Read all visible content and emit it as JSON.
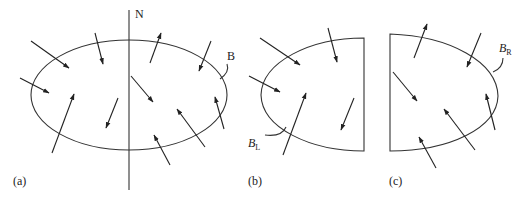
{
  "figure": {
    "panels": [
      {
        "id": "a",
        "label": "(a)",
        "boundary_label": "B",
        "divider_label": "N"
      },
      {
        "id": "b",
        "label": "(b)",
        "boundary_label": "B",
        "boundary_subscript": "L"
      },
      {
        "id": "c",
        "label": "(c)",
        "boundary_label": "B",
        "boundary_subscript": "R"
      }
    ],
    "colors": {
      "line": "#333333",
      "background": "#ffffff"
    }
  }
}
